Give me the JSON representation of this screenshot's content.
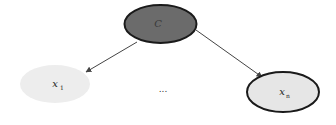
{
  "diagram": {
    "type": "graphical-model",
    "nodes": [
      {
        "id": "C",
        "label": "C",
        "subscript": "",
        "cx": 160.5,
        "cy": 24,
        "rx": 36,
        "ry": 19,
        "fill": "#6b6b6b",
        "stroke": "#1a1a1a",
        "stroke_width": 2,
        "observed": true
      },
      {
        "id": "x1",
        "label": "x",
        "subscript": "1",
        "cx": 55,
        "cy": 84,
        "rx": 35,
        "ry": 19,
        "fill": "#ededed",
        "stroke": "none",
        "stroke_width": 0,
        "observed": false
      },
      {
        "id": "xn",
        "label": "x",
        "subscript": "n",
        "cx": 283,
        "cy": 92,
        "rx": 36,
        "ry": 20,
        "fill": "#e6e6e6",
        "stroke": "#1a1a1a",
        "stroke_width": 2,
        "observed": true
      }
    ],
    "edges": [
      {
        "from": "C",
        "to": "x1",
        "x1": 137,
        "y1": 42,
        "x2": 86,
        "y2": 72
      },
      {
        "from": "C",
        "to": "xn",
        "x1": 196,
        "y1": 30,
        "x2": 262,
        "y2": 77
      }
    ],
    "ellipsis": {
      "text": "...",
      "x": 163,
      "y": 92
    },
    "colors": {
      "edge": "#444444",
      "background": "#ffffff"
    }
  }
}
